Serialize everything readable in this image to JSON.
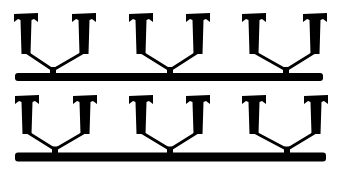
{
  "figure": {
    "background": "#ffffff",
    "ink": "#000000",
    "rows": [
      {
        "bar": {
          "x1": 15,
          "x2": 323,
          "y": 77,
          "thickness": 8
        },
        "cap_top": 13,
        "stem_bottom": 54,
        "groups": [
          {
            "left_x": 26,
            "right_x": 84,
            "junction_x": 53
          },
          {
            "left_x": 141,
            "right_x": 198,
            "junction_x": 170
          },
          {
            "left_x": 254,
            "right_x": 315,
            "junction_x": 286
          }
        ]
      },
      {
        "bar": {
          "x1": 15,
          "x2": 326,
          "y": 157,
          "thickness": 9
        },
        "cap_top": 95,
        "stem_bottom": 134,
        "groups": [
          {
            "left_x": 27,
            "right_x": 85,
            "junction_x": 55
          },
          {
            "left_x": 141,
            "right_x": 198,
            "junction_x": 170
          },
          {
            "left_x": 254,
            "right_x": 316,
            "junction_x": 287
          }
        ]
      }
    ]
  }
}
